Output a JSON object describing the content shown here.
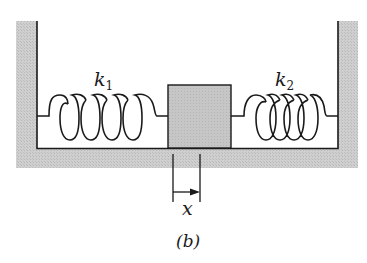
{
  "figure": {
    "caption": "(b)"
  },
  "labels": {
    "spring_left": "k",
    "spring_left_sub": "1",
    "spring_right": "k",
    "spring_right_sub": "2",
    "displacement": "x"
  },
  "colors": {
    "ground_fill": "#c8c8c8",
    "block_fill": "#c4c4c4",
    "line": "#1a1a1a",
    "background": "#ffffff"
  }
}
